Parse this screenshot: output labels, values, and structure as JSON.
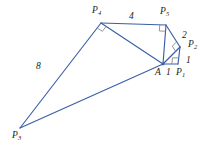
{
  "figure": {
    "type": "geometry-diagram",
    "stroke_color": "#3a5fa8",
    "right_angle_color": "#8a8a8a",
    "label_color": "#222222",
    "background": "#ffffff",
    "width": 217,
    "height": 148
  },
  "points": [
    {
      "id": "A",
      "base": "A",
      "sub": "",
      "x": 163,
      "y": 64,
      "label_x": 155,
      "label_y": 68
    },
    {
      "id": "P1",
      "base": "P",
      "sub": "1",
      "x": 178,
      "y": 64,
      "label_x": 176,
      "label_y": 68
    },
    {
      "id": "P2",
      "base": "P",
      "sub": "2",
      "x": 180,
      "y": 47,
      "label_x": 188,
      "label_y": 40
    },
    {
      "id": "P3",
      "base": "P",
      "sub": "3",
      "x": 20,
      "y": 128,
      "label_x": 12,
      "label_y": 131
    },
    {
      "id": "P4",
      "base": "P",
      "sub": "4",
      "x": 101,
      "y": 23,
      "label_x": 92,
      "label_y": 6
    },
    {
      "id": "P5",
      "base": "P",
      "sub": "5",
      "x": 166,
      "y": 25,
      "label_x": 160,
      "label_y": 7
    }
  ],
  "segments": [
    {
      "from": "A",
      "to": "P1"
    },
    {
      "from": "P1",
      "to": "P2"
    },
    {
      "from": "A",
      "to": "P2"
    },
    {
      "from": "P2",
      "to": "P5"
    },
    {
      "from": "A",
      "to": "P5"
    },
    {
      "from": "P5",
      "to": "P4"
    },
    {
      "from": "A",
      "to": "P4"
    },
    {
      "from": "P4",
      "to": "P3"
    },
    {
      "from": "A",
      "to": "P3"
    }
  ],
  "side_lengths": [
    {
      "value": "1",
      "x": 166,
      "y": 68,
      "name": "length-A-P1"
    },
    {
      "value": "1",
      "x": 186,
      "y": 56,
      "name": "length-P1-P2"
    },
    {
      "value": "2",
      "x": 182,
      "y": 31,
      "name": "length-P2-P5"
    },
    {
      "value": "4",
      "x": 129,
      "y": 12,
      "name": "length-P5-P4"
    },
    {
      "value": "8",
      "x": 36,
      "y": 62,
      "name": "length-P4-P3"
    }
  ],
  "right_angles": [
    {
      "vertex": "P1",
      "arm1": "A",
      "arm2": "P2",
      "name": "right-angle-at-p1"
    },
    {
      "vertex": "P2",
      "arm1": "A",
      "arm2": "P5",
      "name": "right-angle-at-p2"
    },
    {
      "vertex": "P5",
      "arm1": "A",
      "arm2": "P4",
      "name": "right-angle-at-p5"
    },
    {
      "vertex": "P4",
      "arm1": "A",
      "arm2": "P3",
      "name": "right-angle-at-p4"
    }
  ]
}
